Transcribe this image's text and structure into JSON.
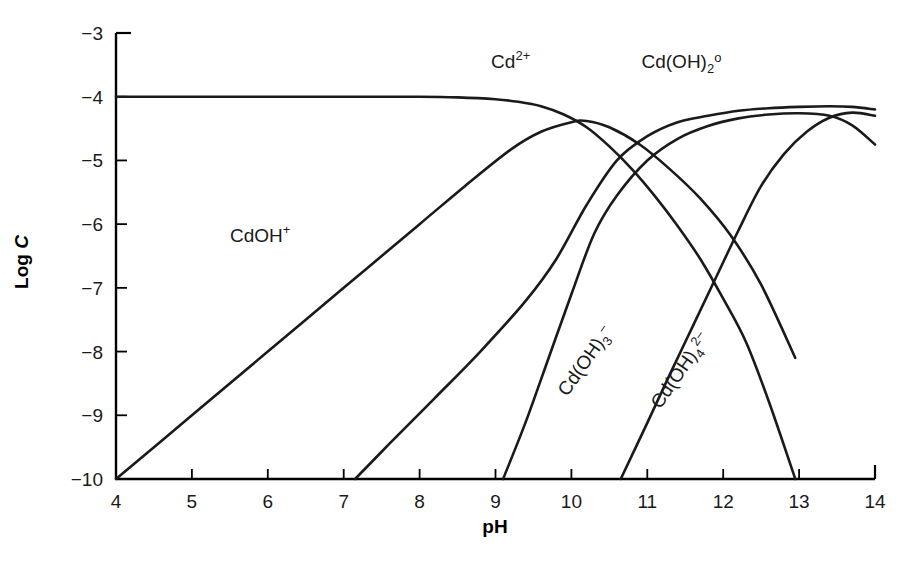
{
  "chart_data": {
    "type": "line",
    "title": "",
    "xlabel": "pH",
    "ylabel": "Log C",
    "xlim": [
      4,
      14
    ],
    "ylim": [
      -10,
      -3
    ],
    "grid": false,
    "legend_position": "inline-labels",
    "xticks": [
      "4",
      "5",
      "6",
      "7",
      "8",
      "9",
      "10",
      "11",
      "12",
      "13",
      "14"
    ],
    "yticks": [
      "−3",
      "−4",
      "−5",
      "−6",
      "−7",
      "−8",
      "−9",
      "−10"
    ],
    "series": [
      {
        "name": "Cd2+",
        "label_text": "Cd",
        "label_sup": "2+",
        "label_sub": "",
        "label_x": 9.2,
        "label_y": -3.55,
        "label_rotate": 0,
        "x": [
          4.0,
          5.0,
          6.0,
          7.0,
          8.0,
          8.5,
          9.0,
          9.3,
          9.6,
          9.9,
          10.2,
          10.5,
          10.8,
          11.1,
          11.4,
          11.7,
          12.0,
          12.3,
          12.6,
          12.95
        ],
        "y": [
          -4.0,
          -4.0,
          -4.0,
          -4.0,
          -4.0,
          -4.01,
          -4.04,
          -4.08,
          -4.15,
          -4.28,
          -4.48,
          -4.78,
          -5.14,
          -5.56,
          -6.03,
          -6.55,
          -7.17,
          -7.85,
          -8.78,
          -10.0
        ]
      },
      {
        "name": "CdOH+",
        "label_text": "CdOH",
        "label_sup": "+",
        "label_sub": "",
        "label_x": 5.9,
        "label_y": -6.28,
        "label_rotate": 0,
        "x": [
          4.0,
          5.0,
          6.0,
          7.0,
          8.0,
          8.6,
          9.2,
          9.6,
          10.0,
          10.2,
          10.5,
          10.9,
          11.3,
          11.7,
          12.1,
          12.5,
          12.95
        ],
        "y": [
          -10.0,
          -9.0,
          -8.0,
          -7.0,
          -6.0,
          -5.4,
          -4.83,
          -4.55,
          -4.4,
          -4.38,
          -4.48,
          -4.75,
          -5.14,
          -5.6,
          -6.18,
          -6.95,
          -8.1
        ]
      },
      {
        "name": "Cd(OH)2o",
        "label_text": "Cd(OH)",
        "label_sup": "o",
        "label_sub": "2",
        "label_x": 11.45,
        "label_y": -3.55,
        "label_rotate": 0,
        "x": [
          7.15,
          7.6,
          8.2,
          8.8,
          9.4,
          9.8,
          10.2,
          10.6,
          11.0,
          11.4,
          11.8,
          12.2,
          12.6,
          13.0,
          13.4,
          13.7,
          14.0
        ],
        "y": [
          -10.0,
          -9.45,
          -8.73,
          -8.0,
          -7.2,
          -6.55,
          -5.7,
          -5.0,
          -4.62,
          -4.4,
          -4.3,
          -4.22,
          -4.18,
          -4.16,
          -4.15,
          -4.16,
          -4.2
        ]
      },
      {
        "name": "Cd(OH)3-",
        "label_text": "Cd(OH)",
        "label_sup": "−",
        "label_sub": "3",
        "label_x": 10.25,
        "label_y": -8.2,
        "label_rotate": -55,
        "x": [
          9.1,
          9.4,
          9.7,
          10.0,
          10.3,
          10.6,
          11.0,
          11.4,
          11.8,
          12.2,
          12.6,
          13.0,
          13.4,
          13.7,
          14.0
        ],
        "y": [
          -10.0,
          -9.1,
          -8.1,
          -7.1,
          -6.15,
          -5.55,
          -5.0,
          -4.66,
          -4.46,
          -4.34,
          -4.28,
          -4.26,
          -4.3,
          -4.45,
          -4.75
        ]
      },
      {
        "name": "Cd(OH)4 2-",
        "label_text": "Cd(OH)",
        "label_sup": "2−",
        "label_sub": "4",
        "label_x": 11.5,
        "label_y": -8.35,
        "label_rotate": -55,
        "x": [
          10.65,
          11.0,
          11.3,
          11.6,
          11.9,
          12.2,
          12.5,
          12.8,
          13.1,
          13.4,
          13.7,
          14.0
        ],
        "y": [
          -10.0,
          -9.12,
          -8.35,
          -7.6,
          -6.85,
          -6.1,
          -5.4,
          -4.9,
          -4.55,
          -4.33,
          -4.25,
          -4.3
        ]
      }
    ]
  },
  "axes": {
    "x_axis_name": "pH",
    "y_axis_name_main": "Log ",
    "y_axis_name_italic": "C"
  },
  "colors": {
    "line": "#1a1a1a",
    "axis": "#000000",
    "background": "#ffffff"
  }
}
